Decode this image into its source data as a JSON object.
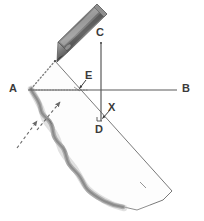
{
  "figure": {
    "background_color": "#ffffff",
    "ink_color": "#555555",
    "shade_color": "#8a8a8a",
    "label_color": "#3a3a3a",
    "pencil_color": "#6e6e6e"
  },
  "labels": {
    "a": "A",
    "b": "B",
    "c": "C",
    "d": "D",
    "e": "E",
    "x": "X"
  },
  "points": {
    "apex": {
      "x": 55,
      "y": 61,
      "name": "apex-vertex"
    },
    "A": {
      "x": 31,
      "y": 90,
      "name": "point-a"
    },
    "B": {
      "x": 177,
      "y": 90,
      "name": "point-b"
    },
    "C": {
      "x": 101,
      "y": 43,
      "name": "point-c"
    },
    "D": {
      "x": 101,
      "y": 121,
      "name": "point-d"
    },
    "E": {
      "x": 79,
      "y": 90,
      "name": "point-e"
    },
    "X": {
      "x": 103,
      "y": 118,
      "name": "point-x"
    }
  },
  "label_positions": {
    "a": {
      "left": 9,
      "top": 83
    },
    "b": {
      "left": 182,
      "top": 83
    },
    "c": {
      "left": 96,
      "top": 27
    },
    "d": {
      "left": 95,
      "top": 125
    },
    "e": {
      "left": 84,
      "top": 71
    },
    "x": {
      "left": 108,
      "top": 104
    }
  },
  "elements": {
    "horizontal_line": "line-AB",
    "vertical_line": "line-CD",
    "diagonal_line": "line-apex-to-bottom-right",
    "dotted_edge": "dotted-line-apex-to-A",
    "dotted_guide": "dotted-horizontal-guide-from-A",
    "shape": "wavy-shaded-strip",
    "pencil": "pencil-stylus",
    "annotation_arrows": [
      "arrow-to-E",
      "arrow-to-X",
      "dashed-arrow-upper",
      "dashed-arrow-lower"
    ]
  }
}
